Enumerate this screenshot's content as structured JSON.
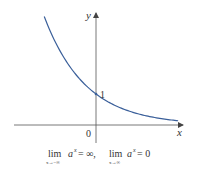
{
  "chart_data": {
    "type": "line",
    "title": "",
    "xlabel": "x",
    "ylabel": "y",
    "function": "a^x (0 < a < 1)",
    "series": [
      {
        "name": "y = a^x",
        "color": "#3a5f9a",
        "x": [
          -2.3,
          -2.0,
          -1.5,
          -1.0,
          -0.5,
          0,
          0.5,
          1.0,
          1.5,
          2.0,
          2.5,
          3.0,
          3.5,
          3.65
        ],
        "y": [
          3.55,
          3.0,
          2.3,
          1.74,
          1.32,
          1.0,
          0.76,
          0.58,
          0.44,
          0.33,
          0.25,
          0.19,
          0.145,
          0.135
        ]
      }
    ],
    "annotations": {
      "origin_label": "0",
      "y_intercept_label": "1"
    },
    "caption": {
      "lim1_sub": "x→−∞",
      "lim1_expr": "a",
      "lim1_exp": "x",
      "lim1_value": "= ∞,",
      "lim2_sub": "x→∞",
      "lim2_expr": "a",
      "lim2_exp": "x",
      "lim2_value": "= 0",
      "lim_word": "lim"
    },
    "xlim": [
      -3.2,
      3.9
    ],
    "ylim": [
      -0.7,
      4.0
    ],
    "grid": false
  }
}
